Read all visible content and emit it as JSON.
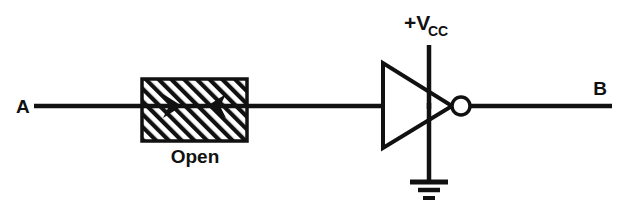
{
  "figure": {
    "kind": "schematic",
    "background_color": "#ffffff",
    "ink_color": "#111111"
  },
  "labels": {
    "input_terminal": "A",
    "output_terminal": "B",
    "fault": "Open",
    "supply_main": "+V",
    "supply_subscript": "CC"
  },
  "components": {
    "fault_box": {
      "name": "Open",
      "fill_pattern": "diagonal-hatch",
      "hatch_angle_deg": 45,
      "x": 142,
      "y": 79,
      "width": 105,
      "height": 62
    },
    "inverter": {
      "name": "inverter-gate",
      "symbol": "triangle-with-bubble",
      "triangle_x": 383,
      "triangle_top_y": 63,
      "triangle_bottom_y": 147,
      "triangle_tip_x": 452,
      "bubble_cx": 461,
      "bubble_cy": 106,
      "bubble_r": 9
    },
    "supply_rail": {
      "name": "vcc-rail",
      "x": 429,
      "top_y": 45,
      "bottom_y": 106
    },
    "ground": {
      "name": "ground-symbol",
      "x": 429,
      "top_y": 106,
      "bar_y": 182,
      "bar_widths": [
        38,
        22,
        12
      ]
    },
    "wires": {
      "input_wire_y": 106,
      "input_wire_x1": 34,
      "input_wire_x2": 383,
      "output_wire_y": 106,
      "output_wire_x1": 470,
      "output_wire_x2": 612
    },
    "fault_arrows": {
      "name": "break-arrows",
      "left_arrow_tip_x": 178,
      "right_arrow_tip_x": 211,
      "y": 106,
      "direction": "inward"
    }
  }
}
